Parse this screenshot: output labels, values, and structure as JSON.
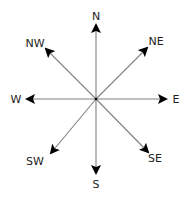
{
  "diagram": {
    "colors": {
      "line": "#808080",
      "arrowhead": "#000000",
      "text": "#222222",
      "background": "#ffffff"
    },
    "center": {
      "x": 96,
      "y": 99
    },
    "directions": [
      {
        "id": "n",
        "label": "N",
        "tip": {
          "x": 96,
          "y": 25
        },
        "label_pos": {
          "x": 96,
          "y": 20
        }
      },
      {
        "id": "ne",
        "label": "NE",
        "tip": {
          "x": 147,
          "y": 48
        },
        "label_pos": {
          "x": 156,
          "y": 45
        }
      },
      {
        "id": "e",
        "label": "E",
        "tip": {
          "x": 166,
          "y": 99
        },
        "label_pos": {
          "x": 176,
          "y": 103
        }
      },
      {
        "id": "se",
        "label": "SE",
        "tip": {
          "x": 148,
          "y": 152
        },
        "label_pos": {
          "x": 155,
          "y": 162
        }
      },
      {
        "id": "s",
        "label": "S",
        "tip": {
          "x": 96,
          "y": 173
        },
        "label_pos": {
          "x": 96,
          "y": 188
        }
      },
      {
        "id": "sw",
        "label": "SW",
        "tip": {
          "x": 51,
          "y": 153
        },
        "label_pos": {
          "x": 35,
          "y": 165
        }
      },
      {
        "id": "w",
        "label": "W",
        "tip": {
          "x": 27,
          "y": 99
        },
        "label_pos": {
          "x": 16,
          "y": 103
        }
      },
      {
        "id": "nw",
        "label": "NW",
        "tip": {
          "x": 46,
          "y": 49
        },
        "label_pos": {
          "x": 35,
          "y": 47
        }
      }
    ]
  }
}
